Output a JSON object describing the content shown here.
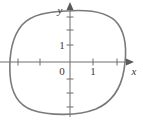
{
  "figure": {
    "kind": "closed-curve-on-cartesian-axes",
    "background_color": "#ffffff",
    "curve_color": "#7a7a7a",
    "axis_color": "#6e6e6e",
    "label_color": "#3a3a3a"
  },
  "axes": {
    "x_axis": {
      "label": "x",
      "label_position": {
        "x": 133,
        "y": 71
      },
      "line": {
        "x1": 0,
        "y1": 62,
        "x2": 130,
        "y2": 62
      },
      "arrow": "right-arrowhead",
      "ticks": [
        {
          "value": "-2",
          "x": 18,
          "labeled": false
        },
        {
          "value": "-1",
          "x": 40,
          "labeled": false
        },
        {
          "value": "1",
          "x": 93,
          "labeled": true
        },
        {
          "value": "2",
          "x": 117,
          "labeled": false
        }
      ]
    },
    "y_axis": {
      "label": "y",
      "label_position": {
        "x": 62,
        "y": 12
      },
      "line": {
        "x1": 70,
        "y1": 6,
        "x2": 70,
        "y2": 116
      },
      "arrow": "up-arrowhead",
      "ticks": [
        {
          "value": "3",
          "y": 17,
          "labeled": false
        },
        {
          "value": "2",
          "y": 30,
          "labeled": false
        },
        {
          "value": "1",
          "y": 45,
          "labeled": true
        },
        {
          "value": "-1",
          "y": 79,
          "labeled": false
        },
        {
          "value": "-2",
          "y": 93,
          "labeled": false
        },
        {
          "value": "-3",
          "y": 107,
          "labeled": false
        }
      ]
    },
    "origin": {
      "label": "0",
      "position": {
        "x": 61,
        "y": 71
      }
    }
  },
  "labels": {
    "x_axis_name": "x",
    "y_axis_name": "y",
    "origin": "0",
    "x_tick_one": "1",
    "y_tick_one": "1"
  },
  "curve": {
    "description": "closed rounded-square (superellipse-like) loop enclosing the origin",
    "path": "M 66 11 C 92 9 110 13 118 24 C 126 35 127 52 124 70 C 121 88 112 102 96 109 C 78 116 50 116 32 110 C 18 105 11 92 10 74 C 9 54 12 37 22 25 C 32 14 48 12 66 11 Z"
  }
}
